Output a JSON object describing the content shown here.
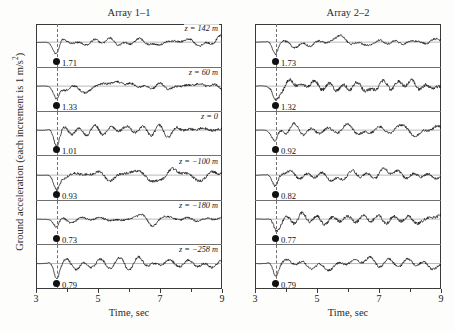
{
  "figure": {
    "ylabel_text": "Ground acceleration (each increment is 1 m/s",
    "ylabel_sup": "2",
    "ylabel_tail": ")",
    "xlabel": "Time, sec",
    "background_color": "#fdfdfc",
    "line_color": "#111111",
    "marker_color": "#111111",
    "dashed_line_color": "#707070"
  },
  "chart_data": {
    "type": "line",
    "xlabel": "Time, sec",
    "ylabel": "Ground acceleration (each increment is 1 m/s^2)",
    "xlim": [
      3,
      9
    ],
    "xticks": [
      3,
      5,
      7,
      9
    ],
    "xtick_labels": [
      "3",
      "5",
      "7",
      "9"
    ],
    "xminor_ticks": [
      4,
      6,
      8
    ],
    "grid": false,
    "legend": "none",
    "arrival_time_marker_sec": 3.65,
    "panels": [
      {
        "name": "Array 1-1",
        "title": "Array 1–1",
        "traces": [
          {
            "depth_label": "z = 142 m",
            "depth_m": 142,
            "peak_value": "1.71",
            "value": 1.71
          },
          {
            "depth_label": "z = 60 m",
            "depth_m": 60,
            "peak_value": "1.33",
            "value": 1.33
          },
          {
            "depth_label": "z = 0",
            "depth_m": 0,
            "peak_value": "1.01",
            "value": 1.01
          },
          {
            "depth_label": "z = −100 m",
            "depth_m": -100,
            "peak_value": "0.93",
            "value": 0.93
          },
          {
            "depth_label": "z = −180 m",
            "depth_m": -180,
            "peak_value": "0.73",
            "value": 0.73
          },
          {
            "depth_label": "z = −258 m",
            "depth_m": -258,
            "peak_value": "0.79",
            "value": 0.79
          }
        ]
      },
      {
        "name": "Array 2-2",
        "title": "Array 2–2",
        "traces": [
          {
            "depth_label": "",
            "depth_m": 142,
            "peak_value": "1.73",
            "value": 1.73
          },
          {
            "depth_label": "",
            "depth_m": 60,
            "peak_value": "1.32",
            "value": 1.32
          },
          {
            "depth_label": "",
            "depth_m": 0,
            "peak_value": "0.92",
            "value": 0.92
          },
          {
            "depth_label": "",
            "depth_m": -100,
            "peak_value": "0.82",
            "value": 0.82
          },
          {
            "depth_label": "",
            "depth_m": -180,
            "peak_value": "0.77",
            "value": 0.77
          },
          {
            "depth_label": "",
            "depth_m": -258,
            "peak_value": "0.79",
            "value": 0.79
          }
        ]
      }
    ]
  }
}
